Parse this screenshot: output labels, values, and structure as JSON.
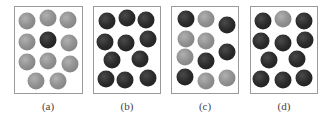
{
  "colors": {
    "light": "#929292",
    "dark": "#2a2a2a",
    "border": "#9a9a9a"
  },
  "panels": [
    {
      "label": "(a)",
      "left": 14,
      "width": 69,
      "center": 48,
      "balls": [
        {
          "x": 27,
          "y": 21,
          "c": "light"
        },
        {
          "x": 48,
          "y": 18,
          "c": "light"
        },
        {
          "x": 68,
          "y": 20,
          "c": "light"
        },
        {
          "x": 27,
          "y": 42,
          "c": "light"
        },
        {
          "x": 48,
          "y": 40,
          "c": "dark"
        },
        {
          "x": 69,
          "y": 43,
          "c": "light"
        },
        {
          "x": 27,
          "y": 62,
          "c": "light"
        },
        {
          "x": 48,
          "y": 61,
          "c": "light"
        },
        {
          "x": 70,
          "y": 64,
          "c": "light"
        },
        {
          "x": 36,
          "y": 81,
          "c": "light"
        },
        {
          "x": 58,
          "y": 81,
          "c": "light"
        }
      ]
    },
    {
      "label": "(b)",
      "left": 93,
      "width": 68,
      "center": 127,
      "balls": [
        {
          "x": 107,
          "y": 21,
          "c": "dark"
        },
        {
          "x": 127,
          "y": 18,
          "c": "dark"
        },
        {
          "x": 146,
          "y": 20,
          "c": "dark"
        },
        {
          "x": 105,
          "y": 42,
          "c": "dark"
        },
        {
          "x": 126,
          "y": 43,
          "c": "dark"
        },
        {
          "x": 148,
          "y": 39,
          "c": "dark"
        },
        {
          "x": 112,
          "y": 60,
          "c": "dark"
        },
        {
          "x": 140,
          "y": 59,
          "c": "dark"
        },
        {
          "x": 106,
          "y": 79,
          "c": "dark"
        },
        {
          "x": 125,
          "y": 80,
          "c": "dark"
        },
        {
          "x": 148,
          "y": 78,
          "c": "dark"
        }
      ]
    },
    {
      "label": "(c)",
      "left": 171,
      "width": 68,
      "center": 205,
      "balls": [
        {
          "x": 186,
          "y": 19,
          "c": "dark"
        },
        {
          "x": 206,
          "y": 19,
          "c": "light"
        },
        {
          "x": 227,
          "y": 25,
          "c": "dark"
        },
        {
          "x": 186,
          "y": 39,
          "c": "light"
        },
        {
          "x": 206,
          "y": 41,
          "c": "light"
        },
        {
          "x": 227,
          "y": 52,
          "c": "dark"
        },
        {
          "x": 185,
          "y": 57,
          "c": "light"
        },
        {
          "x": 206,
          "y": 61,
          "c": "dark"
        },
        {
          "x": 185,
          "y": 77,
          "c": "dark"
        },
        {
          "x": 206,
          "y": 81,
          "c": "light"
        },
        {
          "x": 227,
          "y": 78,
          "c": "light"
        }
      ]
    },
    {
      "label": "(d)",
      "left": 250,
      "width": 68,
      "center": 284,
      "balls": [
        {
          "x": 263,
          "y": 21,
          "c": "dark"
        },
        {
          "x": 283,
          "y": 19,
          "c": "light"
        },
        {
          "x": 304,
          "y": 21,
          "c": "dark"
        },
        {
          "x": 261,
          "y": 41,
          "c": "dark"
        },
        {
          "x": 283,
          "y": 43,
          "c": "dark"
        },
        {
          "x": 305,
          "y": 40,
          "c": "dark"
        },
        {
          "x": 269,
          "y": 60,
          "c": "dark"
        },
        {
          "x": 297,
          "y": 59,
          "c": "dark"
        },
        {
          "x": 261,
          "y": 79,
          "c": "dark"
        },
        {
          "x": 283,
          "y": 80,
          "c": "dark"
        },
        {
          "x": 304,
          "y": 78,
          "c": "dark"
        }
      ]
    }
  ]
}
